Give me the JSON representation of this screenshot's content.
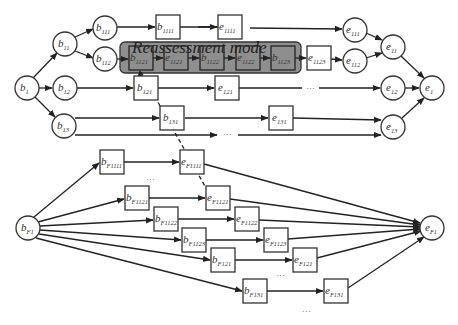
{
  "reassessment_mode": {
    "label": "Reassessment mode",
    "box": {
      "x": 120,
      "y": 42,
      "w": 181,
      "h": 31
    }
  },
  "nodes": [
    {
      "id": "b1",
      "base": "b",
      "sub": "1",
      "shape": "circle",
      "x": 27,
      "y": 88
    },
    {
      "id": "b11",
      "base": "b",
      "sub": "11",
      "shape": "circle",
      "x": 65,
      "y": 44
    },
    {
      "id": "b12",
      "base": "b",
      "sub": "12",
      "shape": "circle",
      "x": 65,
      "y": 88
    },
    {
      "id": "b13",
      "base": "b",
      "sub": "13",
      "shape": "circle",
      "x": 64,
      "y": 126
    },
    {
      "id": "b111",
      "base": "b",
      "sub": "111",
      "shape": "circle",
      "x": 105,
      "y": 28
    },
    {
      "id": "b112",
      "base": "b",
      "sub": "112",
      "shape": "circle",
      "x": 105,
      "y": 59
    },
    {
      "id": "b1111",
      "base": "b",
      "sub": "1111",
      "shape": "box",
      "x": 168,
      "y": 27
    },
    {
      "id": "e1111",
      "base": "e",
      "sub": "1111",
      "shape": "box",
      "x": 230,
      "y": 27
    },
    {
      "id": "b1121",
      "base": "b",
      "sub": "1121",
      "shape": "box",
      "x": 141,
      "y": 58,
      "in_mode": true
    },
    {
      "id": "e1121",
      "base": "e",
      "sub": "1121",
      "shape": "box",
      "x": 176,
      "y": 58,
      "in_mode": true
    },
    {
      "id": "b1122",
      "base": "b",
      "sub": "1122",
      "shape": "box",
      "x": 212,
      "y": 58,
      "in_mode": true
    },
    {
      "id": "e1122",
      "base": "e",
      "sub": "1122",
      "shape": "box",
      "x": 248,
      "y": 58,
      "in_mode": true
    },
    {
      "id": "b1123",
      "base": "b",
      "sub": "1123",
      "shape": "box",
      "x": 283,
      "y": 58,
      "in_mode": true
    },
    {
      "id": "e1123",
      "base": "e",
      "sub": "1123",
      "shape": "box",
      "x": 319,
      "y": 58
    },
    {
      "id": "b121",
      "base": "b",
      "sub": "121",
      "shape": "box",
      "x": 146,
      "y": 88
    },
    {
      "id": "e121",
      "base": "e",
      "sub": "121",
      "shape": "box",
      "x": 227,
      "y": 88
    },
    {
      "id": "b131",
      "base": "b",
      "sub": "131",
      "shape": "box",
      "x": 172,
      "y": 118
    },
    {
      "id": "e131",
      "base": "e",
      "sub": "131",
      "shape": "box",
      "x": 281,
      "y": 118
    },
    {
      "id": "e111",
      "base": "e",
      "sub": "111",
      "shape": "circle",
      "x": 355,
      "y": 30
    },
    {
      "id": "e112",
      "base": "e",
      "sub": "112",
      "shape": "circle",
      "x": 355,
      "y": 61
    },
    {
      "id": "e11",
      "base": "e",
      "sub": "11",
      "shape": "circle",
      "x": 393,
      "y": 47
    },
    {
      "id": "e12",
      "base": "e",
      "sub": "12",
      "shape": "circle",
      "x": 393,
      "y": 88
    },
    {
      "id": "e13",
      "base": "e",
      "sub": "13",
      "shape": "circle",
      "x": 393,
      "y": 127
    },
    {
      "id": "e1",
      "base": "e",
      "sub": "1",
      "shape": "circle",
      "x": 432,
      "y": 88
    },
    {
      "id": "bF1",
      "base": "b",
      "sub": "F1",
      "shape": "circle",
      "x": 28,
      "y": 228
    },
    {
      "id": "bF1111",
      "base": "b",
      "sub": "F1111",
      "shape": "box",
      "x": 112,
      "y": 162
    },
    {
      "id": "eF1111",
      "base": "e",
      "sub": "F1111",
      "shape": "box",
      "x": 192,
      "y": 162
    },
    {
      "id": "bF1121",
      "base": "b",
      "sub": "F1121",
      "shape": "box",
      "x": 137,
      "y": 198
    },
    {
      "id": "eF1121",
      "base": "e",
      "sub": "F1121",
      "shape": "box",
      "x": 218,
      "y": 198
    },
    {
      "id": "bF1122",
      "base": "b",
      "sub": "F1122",
      "shape": "box",
      "x": 166,
      "y": 219
    },
    {
      "id": "eF1122",
      "base": "e",
      "sub": "F1122",
      "shape": "box",
      "x": 247,
      "y": 219
    },
    {
      "id": "bF1123",
      "base": "b",
      "sub": "F1123",
      "shape": "box",
      "x": 194,
      "y": 240
    },
    {
      "id": "eF1123",
      "base": "e",
      "sub": "F1123",
      "shape": "box",
      "x": 276,
      "y": 240
    },
    {
      "id": "bF121",
      "base": "b",
      "sub": "F121",
      "shape": "box",
      "x": 223,
      "y": 260
    },
    {
      "id": "eF121",
      "base": "e",
      "sub": "F121",
      "shape": "box",
      "x": 305,
      "y": 260
    },
    {
      "id": "bF131",
      "base": "b",
      "sub": "F131",
      "shape": "box",
      "x": 255,
      "y": 291
    },
    {
      "id": "eF131",
      "base": "e",
      "sub": "F131",
      "shape": "box",
      "x": 336,
      "y": 291
    },
    {
      "id": "eF1",
      "base": "e",
      "sub": "F1",
      "shape": "circle",
      "x": 432,
      "y": 228
    }
  ],
  "ellipses": [
    {
      "x": 208,
      "y": 30
    },
    {
      "x": 311,
      "y": 91
    },
    {
      "x": 228,
      "y": 137
    },
    {
      "x": 151,
      "y": 182
    },
    {
      "x": 281,
      "y": 278
    },
    {
      "x": 307,
      "y": 314
    }
  ],
  "node_size": {
    "radius": 12,
    "box": 24
  }
}
